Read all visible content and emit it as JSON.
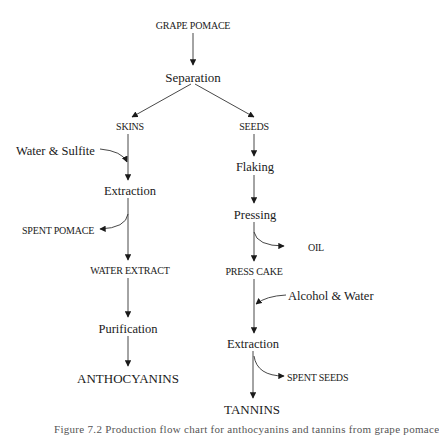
{
  "diagram": {
    "type": "process-flow-chart",
    "nodes": {
      "grape_pomace": "GRAPE POMACE",
      "separation": "Separation",
      "skins": "SKINS",
      "seeds": "SEEDS",
      "water_sulfite": "Water & Sulfite",
      "extraction_left": "Extraction",
      "spent_pomace": "SPENT POMACE",
      "water_extract": "WATER EXTRACT",
      "purification": "Purification",
      "anthocyanins": "ANTHOCYANINS",
      "flaking": "Flaking",
      "pressing": "Pressing",
      "oil": "OIL",
      "press_cake": "PRESS CAKE",
      "alcohol_water": "Alcohol & Water",
      "extraction_right": "Extraction",
      "spent_seeds": "SPENT SEEDS",
      "tannins": "TANNINS"
    },
    "edges": [
      [
        "GRAPE POMACE",
        "Separation"
      ],
      [
        "Separation",
        "SKINS"
      ],
      [
        "Separation",
        "SEEDS"
      ],
      [
        "SKINS",
        "Extraction (left)"
      ],
      [
        "Water & Sulfite",
        "Extraction (left)"
      ],
      [
        "Extraction (left)",
        "SPENT POMACE"
      ],
      [
        "Extraction (left)",
        "WATER EXTRACT"
      ],
      [
        "WATER EXTRACT",
        "Purification"
      ],
      [
        "Purification",
        "ANTHOCYANINS"
      ],
      [
        "SEEDS",
        "Flaking"
      ],
      [
        "Flaking",
        "Pressing"
      ],
      [
        "Pressing",
        "OIL"
      ],
      [
        "Pressing",
        "PRESS CAKE"
      ],
      [
        "PRESS CAKE",
        "Extraction (right)"
      ],
      [
        "Alcohol & Water",
        "Extraction (right)"
      ],
      [
        "Extraction (right)",
        "SPENT SEEDS"
      ],
      [
        "Extraction (right)",
        "TANNINS"
      ]
    ],
    "caption": "Figure 7.2 Production flow chart for anthocyanins and tannins from grape pomace"
  },
  "colors": {
    "ink": "#1a1a1a",
    "background": "#ffffff"
  }
}
